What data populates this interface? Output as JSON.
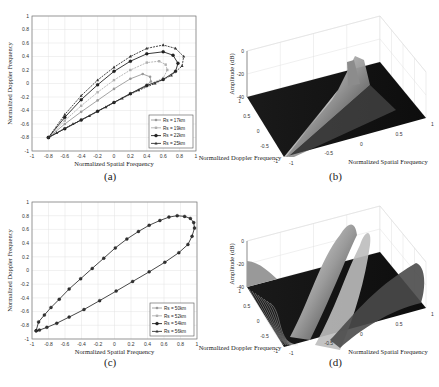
{
  "captions": [
    "(a)",
    "(b)",
    "(c)",
    "(d)"
  ],
  "chart_data": [
    {
      "panel": "a",
      "type": "line",
      "xlabel": "Normalized Spatial Frequency",
      "ylabel": "Normalized Doppler Frequency",
      "xlim": [
        -1,
        1
      ],
      "ylim": [
        -1,
        1
      ],
      "xticks": [
        "-1",
        "-0.8",
        "-0.6",
        "-0.4",
        "-0.2",
        "0",
        "0.2",
        "0.4",
        "0.6",
        "0.8",
        "1"
      ],
      "yticks": [
        "1",
        "0.8",
        "0.6",
        "0.4",
        "0.2",
        "0",
        "-0.2",
        "-0.4",
        "-0.6",
        "-0.8",
        "-1"
      ],
      "grid": true,
      "legend_position": "lower right",
      "series": [
        {
          "name": "Rs = 17km",
          "color": "#9a9a9a",
          "marker": "circle",
          "x": [
            -0.8,
            -0.6,
            -0.4,
            -0.2,
            0.0,
            0.2,
            0.35,
            0.44,
            0.45,
            0.4,
            0.2,
            0.0,
            -0.2,
            -0.4,
            -0.6,
            -0.8
          ],
          "y": [
            -0.8,
            -0.6,
            -0.42,
            -0.25,
            -0.08,
            0.07,
            0.14,
            0.1,
            0.03,
            -0.02,
            -0.15,
            -0.28,
            -0.41,
            -0.54,
            -0.67,
            -0.8
          ]
        },
        {
          "name": "Rs = 19km",
          "color": "#b0b0b0",
          "marker": "square",
          "x": [
            -0.8,
            -0.6,
            -0.4,
            -0.2,
            0.0,
            0.2,
            0.4,
            0.55,
            0.63,
            0.65,
            0.6,
            0.4,
            0.2,
            0.0,
            -0.2,
            -0.4,
            -0.6,
            -0.8
          ],
          "y": [
            -0.8,
            -0.55,
            -0.33,
            -0.13,
            0.05,
            0.2,
            0.31,
            0.33,
            0.28,
            0.2,
            0.08,
            -0.03,
            -0.15,
            -0.28,
            -0.41,
            -0.54,
            -0.67,
            -0.8
          ]
        },
        {
          "name": "Rs = 22km",
          "color": "#222222",
          "marker": "diamond",
          "x": [
            -0.8,
            -0.6,
            -0.4,
            -0.2,
            0.0,
            0.2,
            0.4,
            0.6,
            0.72,
            0.78,
            0.75,
            0.6,
            0.4,
            0.2,
            0.0,
            -0.2,
            -0.4,
            -0.6,
            -0.8
          ],
          "y": [
            -0.8,
            -0.5,
            -0.24,
            -0.02,
            0.18,
            0.33,
            0.44,
            0.47,
            0.42,
            0.3,
            0.18,
            0.06,
            -0.03,
            -0.15,
            -0.28,
            -0.41,
            -0.54,
            -0.67,
            -0.8
          ]
        },
        {
          "name": "Rs = 25km",
          "color": "#333333",
          "marker": "triangle",
          "x": [
            -0.8,
            -0.6,
            -0.4,
            -0.2,
            0.0,
            0.2,
            0.4,
            0.6,
            0.75,
            0.85,
            0.83,
            0.7,
            0.5,
            0.3,
            0.1,
            -0.1,
            -0.3,
            -0.5,
            -0.7,
            -0.8
          ],
          "y": [
            -0.8,
            -0.46,
            -0.18,
            0.05,
            0.24,
            0.4,
            0.52,
            0.57,
            0.52,
            0.4,
            0.26,
            0.12,
            0.0,
            -0.1,
            -0.22,
            -0.35,
            -0.48,
            -0.6,
            -0.73,
            -0.8
          ]
        }
      ]
    },
    {
      "panel": "b",
      "type": "surface",
      "xlabel": "Normalized Spatial Frequency",
      "ylabel": "Normalized Doppler Frequency",
      "zlabel": "Amplitude (dB)",
      "xticks": [
        "-1",
        "-0.5",
        "0",
        "0.5",
        "1"
      ],
      "yticks": [
        "-1",
        "-0.5",
        "0",
        "0.5",
        "1"
      ],
      "zticks": [
        "0",
        "-20",
        "-40"
      ],
      "zlim": [
        -40,
        0
      ]
    },
    {
      "panel": "c",
      "type": "line",
      "xlabel": "Normalized Spatial Frequency",
      "ylabel": "Normalized Doppler Frequency",
      "xlim": [
        -1,
        1
      ],
      "ylim": [
        -1,
        1
      ],
      "xticks": [
        "-1",
        "-0.8",
        "-0.6",
        "-0.4",
        "-0.2",
        "0",
        "0.2",
        "0.4",
        "0.6",
        "0.8",
        "1"
      ],
      "yticks": [
        "1",
        "0.8",
        "0.6",
        "0.4",
        "0.2",
        "0",
        "-0.2",
        "-0.4",
        "-0.6",
        "-0.8",
        "-1"
      ],
      "grid": true,
      "legend_position": "lower right",
      "series": [
        {
          "name": "Rs = 50km",
          "color": "#9a9a9a",
          "marker": "circle"
        },
        {
          "name": "Rs = 52km",
          "color": "#b0b0b0",
          "marker": "square"
        },
        {
          "name": "Rs = 54km",
          "color": "#222222",
          "marker": "diamond"
        },
        {
          "name": "Rs = 56km",
          "color": "#333333",
          "marker": "triangle"
        }
      ],
      "shared_curve": {
        "x": [
          -0.95,
          -0.92,
          -0.85,
          -0.77,
          -0.67,
          -0.55,
          -0.41,
          -0.27,
          -0.13,
          0.01,
          0.15,
          0.29,
          0.42,
          0.55,
          0.66,
          0.76,
          0.85,
          0.92,
          0.96,
          0.97,
          0.94,
          0.89,
          0.78,
          0.61,
          0.42,
          0.22,
          0.02,
          -0.18,
          -0.37,
          -0.55,
          -0.7,
          -0.82,
          -0.91,
          -0.95
        ],
        "y": [
          -0.88,
          -0.75,
          -0.65,
          -0.54,
          -0.42,
          -0.27,
          -0.12,
          0.03,
          0.18,
          0.33,
          0.46,
          0.57,
          0.66,
          0.73,
          0.78,
          0.8,
          0.79,
          0.76,
          0.7,
          0.62,
          0.5,
          0.38,
          0.26,
          0.12,
          -0.02,
          -0.16,
          -0.3,
          -0.44,
          -0.57,
          -0.68,
          -0.77,
          -0.83,
          -0.87,
          -0.88
        ]
      }
    },
    {
      "panel": "d",
      "type": "surface",
      "xlabel": "Normalized Spatial Frequency",
      "ylabel": "Normalized Doppler Frequency",
      "zlabel": "Amplitude (dB)",
      "xticks": [
        "-1",
        "-0.5",
        "0",
        "0.5",
        "1"
      ],
      "yticks": [
        "-1",
        "-0.5",
        "0",
        "0.5",
        "1"
      ],
      "zticks": [
        "0",
        "-20",
        "-40"
      ],
      "zlim": [
        -40,
        0
      ]
    }
  ]
}
